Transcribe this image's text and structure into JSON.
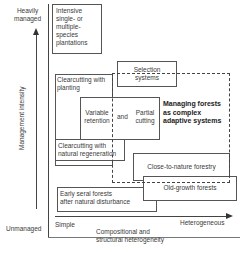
{
  "diagram": {
    "y_axis": {
      "top_label": [
        "Heavily",
        "managed"
      ],
      "title": "Management intensity",
      "bottom_label": "Unmanaged"
    },
    "x_axis": {
      "left_label": "Simple",
      "right_label": "Heterogeneous",
      "title": [
        "Compositional and",
        "structural heterogeneity"
      ]
    },
    "boxes": {
      "intensive": [
        "Intensive",
        "single- or",
        "multiple-",
        "species",
        "plantations"
      ],
      "selection": [
        "Selection",
        "systems"
      ],
      "clearcut_planting": [
        "Clearcutting with",
        "planting"
      ],
      "variable_retention": [
        "Variable",
        "retention"
      ],
      "and": "and",
      "partial_cutting": [
        "Partial",
        "cutting"
      ],
      "clearcut_natural": [
        "Clearcutting with",
        "natural regeneration"
      ],
      "complex_adaptive": [
        "Managing forests",
        "as complex",
        "adaptive systems"
      ],
      "close_to_nature": "Close-to-nature forestry",
      "old_growth": "Old-growth forests",
      "early_seral": [
        "Early seral forests",
        "after natural disturbance"
      ]
    }
  }
}
